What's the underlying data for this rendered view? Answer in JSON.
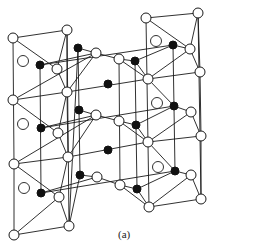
{
  "figure": {
    "caption": "(a)",
    "colors": {
      "line": "#1a1a1a",
      "open_fill": "#ffffff",
      "filled": "#111111",
      "background": "#ffffff"
    },
    "atom_types": {
      "open": "open-circle-atom",
      "filled": "filled-circle-atom",
      "ring": "large-hollow-circle-atom"
    },
    "nodes": [
      {
        "id": "t1",
        "x": 146,
        "y": 18,
        "type": "open"
      },
      {
        "id": "t2",
        "x": 198,
        "y": 13,
        "type": "open"
      },
      {
        "id": "a1",
        "x": 13,
        "y": 38,
        "type": "open"
      },
      {
        "id": "a2",
        "x": 67,
        "y": 30,
        "type": "open"
      },
      {
        "id": "a3",
        "x": 23,
        "y": 61,
        "type": "ring"
      },
      {
        "id": "a4",
        "x": 40,
        "y": 65,
        "type": "filled"
      },
      {
        "id": "a5",
        "x": 57,
        "y": 69,
        "type": "open"
      },
      {
        "id": "a6",
        "x": 78,
        "y": 48,
        "type": "filled"
      },
      {
        "id": "a7",
        "x": 96,
        "y": 53,
        "type": "open"
      },
      {
        "id": "a8",
        "x": 119,
        "y": 59,
        "type": "open"
      },
      {
        "id": "a9",
        "x": 135,
        "y": 61,
        "type": "filled"
      },
      {
        "id": "a10",
        "x": 156,
        "y": 41,
        "type": "ring"
      },
      {
        "id": "a11",
        "x": 173,
        "y": 45,
        "type": "filled"
      },
      {
        "id": "a12",
        "x": 190,
        "y": 49,
        "type": "open"
      },
      {
        "id": "a13",
        "x": 200,
        "y": 72,
        "type": "open"
      },
      {
        "id": "a14",
        "x": 148,
        "y": 79,
        "type": "open"
      },
      {
        "id": "c1",
        "x": 108,
        "y": 84,
        "type": "filled"
      },
      {
        "id": "b1",
        "x": 13,
        "y": 100,
        "type": "open"
      },
      {
        "id": "b2",
        "x": 67,
        "y": 92,
        "type": "open"
      },
      {
        "id": "b3",
        "x": 23,
        "y": 124,
        "type": "ring"
      },
      {
        "id": "b4",
        "x": 41,
        "y": 128,
        "type": "filled"
      },
      {
        "id": "b5",
        "x": 58,
        "y": 133,
        "type": "open"
      },
      {
        "id": "b6",
        "x": 79,
        "y": 110,
        "type": "filled"
      },
      {
        "id": "b7",
        "x": 96,
        "y": 115,
        "type": "open"
      },
      {
        "id": "b8",
        "x": 119,
        "y": 121,
        "type": "open"
      },
      {
        "id": "b9",
        "x": 136,
        "y": 125,
        "type": "filled"
      },
      {
        "id": "b10",
        "x": 157,
        "y": 103,
        "type": "ring"
      },
      {
        "id": "b11",
        "x": 174,
        "y": 106,
        "type": "filled"
      },
      {
        "id": "b12",
        "x": 191,
        "y": 112,
        "type": "open"
      },
      {
        "id": "b13",
        "x": 201,
        "y": 136,
        "type": "open"
      },
      {
        "id": "b14",
        "x": 148,
        "y": 142,
        "type": "open"
      },
      {
        "id": "c2",
        "x": 108,
        "y": 150,
        "type": "filled"
      },
      {
        "id": "d1",
        "x": 14,
        "y": 164,
        "type": "open"
      },
      {
        "id": "d2",
        "x": 68,
        "y": 157,
        "type": "open"
      },
      {
        "id": "d3",
        "x": 24,
        "y": 188,
        "type": "ring"
      },
      {
        "id": "d4",
        "x": 41,
        "y": 193,
        "type": "filled"
      },
      {
        "id": "d5",
        "x": 59,
        "y": 197,
        "type": "open"
      },
      {
        "id": "d6",
        "x": 80,
        "y": 175,
        "type": "filled"
      },
      {
        "id": "d7",
        "x": 97,
        "y": 177,
        "type": "open"
      },
      {
        "id": "d8",
        "x": 120,
        "y": 185,
        "type": "open"
      },
      {
        "id": "d9",
        "x": 137,
        "y": 189,
        "type": "filled"
      },
      {
        "id": "d10",
        "x": 158,
        "y": 167,
        "type": "ring"
      },
      {
        "id": "d11",
        "x": 175,
        "y": 171,
        "type": "filled"
      },
      {
        "id": "d12",
        "x": 191,
        "y": 175,
        "type": "open"
      },
      {
        "id": "d13",
        "x": 201,
        "y": 199,
        "type": "open"
      },
      {
        "id": "d14",
        "x": 149,
        "y": 207,
        "type": "open"
      },
      {
        "id": "e1",
        "x": 69,
        "y": 226,
        "type": "open"
      },
      {
        "id": "e2",
        "x": 14,
        "y": 235,
        "type": "open"
      }
    ],
    "edges": [
      [
        "t1",
        "t2"
      ],
      [
        "t1",
        "a12"
      ],
      [
        "t2",
        "a12"
      ],
      [
        "t2",
        "a13"
      ],
      [
        "a1",
        "a2"
      ],
      [
        "a1",
        "a5"
      ],
      [
        "a2",
        "a5"
      ],
      [
        "a4",
        "a7"
      ],
      [
        "a4",
        "a11"
      ],
      [
        "a6",
        "a7"
      ],
      [
        "a7",
        "a8"
      ],
      [
        "a8",
        "a9"
      ],
      [
        "a9",
        "a11"
      ],
      [
        "a11",
        "a12"
      ],
      [
        "a12",
        "a13"
      ],
      [
        "a5",
        "b2"
      ],
      [
        "a2",
        "b2"
      ],
      [
        "a7",
        "b2"
      ],
      [
        "a8",
        "a14"
      ],
      [
        "a9",
        "a14"
      ],
      [
        "a12",
        "a14"
      ],
      [
        "a13",
        "a14"
      ],
      [
        "a14",
        "b11"
      ],
      [
        "b2",
        "a14"
      ],
      [
        "a13",
        "b13"
      ],
      [
        "b1",
        "b2"
      ],
      [
        "b1",
        "b5"
      ],
      [
        "b1",
        "a7"
      ],
      [
        "b2",
        "b5"
      ],
      [
        "b4",
        "b7"
      ],
      [
        "b4",
        "b11"
      ],
      [
        "b6",
        "b7"
      ],
      [
        "b7",
        "b8"
      ],
      [
        "b8",
        "b9"
      ],
      [
        "b9",
        "b11"
      ],
      [
        "b11",
        "b12"
      ],
      [
        "b12",
        "b13"
      ],
      [
        "b5",
        "d2"
      ],
      [
        "b2",
        "d2"
      ],
      [
        "b7",
        "d2"
      ],
      [
        "b8",
        "b14"
      ],
      [
        "b9",
        "b14"
      ],
      [
        "b12",
        "b14"
      ],
      [
        "b13",
        "b14"
      ],
      [
        "b14",
        "d11"
      ],
      [
        "d2",
        "b14"
      ],
      [
        "b13",
        "d13"
      ],
      [
        "d1",
        "d2"
      ],
      [
        "d1",
        "d5"
      ],
      [
        "d1",
        "b7"
      ],
      [
        "d2",
        "d5"
      ],
      [
        "d4",
        "d7"
      ],
      [
        "d4",
        "d11"
      ],
      [
        "d6",
        "d7"
      ],
      [
        "d7",
        "d8"
      ],
      [
        "d8",
        "d9"
      ],
      [
        "d9",
        "d11"
      ],
      [
        "d11",
        "d12"
      ],
      [
        "d12",
        "d13"
      ],
      [
        "d5",
        "e1"
      ],
      [
        "d5",
        "e2"
      ],
      [
        "e1",
        "e2"
      ],
      [
        "d12",
        "d14"
      ],
      [
        "d13",
        "d14"
      ],
      [
        "d9",
        "d14"
      ],
      [
        "d8",
        "d14"
      ],
      [
        "a1",
        "d1"
      ],
      [
        "d1",
        "e2"
      ],
      [
        "a6",
        "e1"
      ],
      [
        "b6",
        "d6"
      ],
      [
        "a6",
        "b6"
      ],
      [
        "d6",
        "e1"
      ],
      [
        "a2",
        "e1"
      ],
      [
        "a9",
        "d9"
      ],
      [
        "a11",
        "d11"
      ],
      [
        "t1",
        "d14"
      ],
      [
        "t2",
        "d13"
      ],
      [
        "a4",
        "d4"
      ],
      [
        "a8",
        "d8"
      ]
    ]
  }
}
